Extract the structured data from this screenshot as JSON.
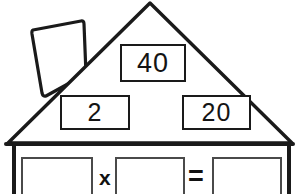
{
  "worksheet": {
    "title": "Multiplication House",
    "shape": "house",
    "line_color": "#1a1a1a",
    "fill_color": "#ffffff",
    "box_border_color": "#4a4a4a"
  },
  "house": {
    "chimney": {
      "label": "chimney"
    },
    "roof": {
      "label": "roof",
      "boxes": [
        {
          "id": "top",
          "value": "40",
          "position": "apex"
        },
        {
          "id": "left",
          "value": "2",
          "position": "lower-left"
        },
        {
          "id": "right",
          "value": "20",
          "position": "lower-right"
        }
      ]
    },
    "wall": {
      "label": "wall"
    }
  },
  "numbers": {
    "top": "40",
    "left": "2",
    "right": "20"
  },
  "equation": {
    "operator_times": "x",
    "operator_equals": "=",
    "blanks": [
      {
        "id": "a",
        "value": "",
        "placeholder": ""
      },
      {
        "id": "b",
        "value": "",
        "placeholder": ""
      },
      {
        "id": "c",
        "value": "",
        "placeholder": ""
      }
    ]
  }
}
